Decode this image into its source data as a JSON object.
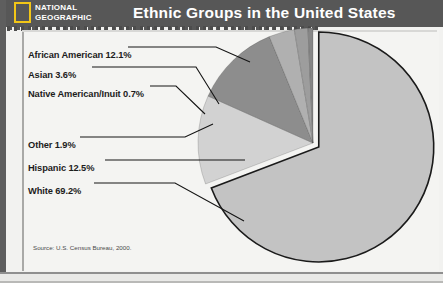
{
  "header": {
    "logo_line1": "NATIONAL",
    "logo_line2": "GEOGRAPHIC",
    "logo_color": "#f2c617",
    "band_color": "#575757",
    "title": "Ethnic Groups in the United States"
  },
  "source_note": "Source: U.S. Census Bureau, 2000.",
  "labels": [
    {
      "text": "African American 12.1%",
      "x": 28,
      "y": 50
    },
    {
      "text": "Asian 3.6%",
      "x": 28,
      "y": 70
    },
    {
      "text": "Native American/Inuit 0.7%",
      "x": 28,
      "y": 89
    },
    {
      "text": "Other 1.9%",
      "x": 28,
      "y": 140
    },
    {
      "text": "Hispanic 12.5%",
      "x": 28,
      "y": 163
    },
    {
      "text": "White 69.2%",
      "x": 28,
      "y": 186
    }
  ],
  "chart_data": {
    "type": "pie",
    "title": "Ethnic Groups in the United States",
    "source": "U.S. Census Bureau, 2000",
    "unit": "percent",
    "categories": [
      "White",
      "Hispanic",
      "African American",
      "Asian",
      "Other",
      "Native American/Inuit"
    ],
    "values": [
      69.2,
      12.5,
      12.1,
      3.6,
      1.9,
      0.7
    ],
    "colors": [
      "#c3c3c3",
      "#d2d2d2",
      "#8d8d8d",
      "#b0b0b0",
      "#9d9d9d",
      "#868686"
    ],
    "legend": "leader-lines",
    "exploded_slice": "White",
    "start_angle_deg": 0,
    "direction": "clockwise",
    "center": {
      "x": 313,
      "y": 143
    },
    "radius": 115,
    "edge_color": "#1a1a1a",
    "gap_color": "#f4f4f2"
  },
  "leader_lines": [
    {
      "name": "african-american",
      "points": "128,47 216,47 250,62"
    },
    {
      "name": "asian",
      "points": "92,67 196,67 219,104"
    },
    {
      "name": "native-american",
      "points": "150,86 176,86 205,114"
    },
    {
      "name": "other",
      "points": "80,137 185,137 213,124"
    },
    {
      "name": "hispanic",
      "points": "105,160 245,160"
    },
    {
      "name": "white",
      "points": "94,183 175,183 244,221"
    }
  ]
}
